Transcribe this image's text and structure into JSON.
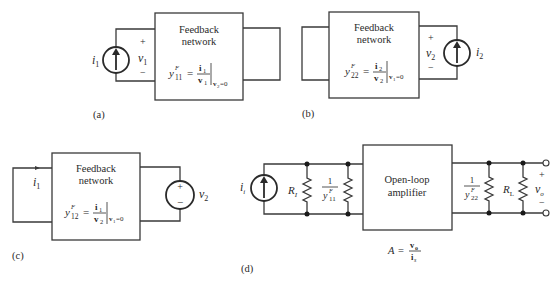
{
  "panels": {
    "a": {
      "label": "(a)",
      "box_title_line1": "Feedback",
      "box_title_line2": "network",
      "source_label": "i",
      "source_sub": "1",
      "port_plus": "+",
      "port_minus": "−",
      "port_voltage": "v",
      "port_voltage_sub": "1",
      "eq_y": "y",
      "eq_sup": "F",
      "eq_sub": "11",
      "eq_equals": "=",
      "eq_num": "i",
      "eq_num_sub": "1",
      "eq_den": "v",
      "eq_den_sub": "1",
      "eq_cond": "v",
      "eq_cond_sub": "2",
      "eq_cond_val": "=0"
    },
    "b": {
      "label": "(b)",
      "box_title_line1": "Feedback",
      "box_title_line2": "network",
      "source_label": "i",
      "source_sub": "2",
      "port_plus": "+",
      "port_minus": "−",
      "port_voltage": "v",
      "port_voltage_sub": "2",
      "eq_y": "y",
      "eq_sup": "F",
      "eq_sub": "22",
      "eq_equals": "=",
      "eq_num": "i",
      "eq_num_sub": "2",
      "eq_den": "v",
      "eq_den_sub": "2",
      "eq_cond": "v",
      "eq_cond_sub": "1",
      "eq_cond_val": "=0"
    },
    "c": {
      "label": "(c)",
      "box_title_line1": "Feedback",
      "box_title_line2": "network",
      "current_label": "i",
      "current_sub": "1",
      "source_label": "v",
      "source_sub": "2",
      "source_plus": "+",
      "source_minus": "−",
      "eq_y": "y",
      "eq_sup": "F",
      "eq_sub": "12",
      "eq_equals": "=",
      "eq_num": "i",
      "eq_num_sub": "1",
      "eq_den": "v",
      "eq_den_sub": "2",
      "eq_cond": "v",
      "eq_cond_sub": "1",
      "eq_cond_val": "=0"
    },
    "d": {
      "label": "(d)",
      "source_label": "i",
      "source_sub": "i",
      "r_in_label": "R",
      "r_in_sub": "I",
      "y11_num": "1",
      "y11_den": "y",
      "y11_sup": "F",
      "y11_sub": "11",
      "amp_line1": "Open-loop",
      "amp_line2": "amplifier",
      "y22_num": "1",
      "y22_den": "y",
      "y22_sup": "F",
      "y22_sub": "22",
      "r_load_label": "R",
      "r_load_sub": "L",
      "out_plus": "+",
      "out_minus": "−",
      "out_voltage": "v",
      "out_voltage_sub": "o",
      "gain_A": "A",
      "gain_equals": "=",
      "gain_num": "v",
      "gain_num_sub": "o",
      "gain_den": "i",
      "gain_den_sub": "s"
    }
  }
}
